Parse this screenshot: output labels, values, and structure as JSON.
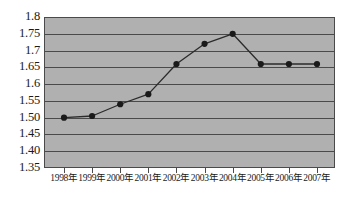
{
  "chart_data": {
    "type": "line",
    "title": "",
    "subtitle": "",
    "xlabel": "",
    "ylabel": "",
    "categories": [
      "1998年",
      "1999年",
      "2000年",
      "2001年",
      "2002年",
      "2003年",
      "2004年",
      "2005年",
      "2006年",
      "2007年"
    ],
    "series": [
      {
        "name": "",
        "values": [
          1.5,
          1.505,
          1.54,
          1.57,
          1.66,
          1.72,
          1.75,
          1.66,
          1.66,
          1.66
        ]
      }
    ],
    "ylim": [
      1.35,
      1.8
    ],
    "ytick_values": [
      1.8,
      1.75,
      1.7,
      1.65,
      1.6,
      1.55,
      1.5,
      1.45,
      1.4,
      1.35
    ],
    "ytick_labels": [
      "1.8",
      "1.75",
      "1.7",
      "1.65",
      "1.6",
      "1.55",
      "1.50",
      "1.45",
      "1.40",
      "1.35"
    ],
    "grid": true,
    "grid_axis": "y",
    "legend": false,
    "legend_position": "none",
    "marker": "filled-circle",
    "colors": {
      "plot_background": "#b0b0b0",
      "grid": "#4a4a4a",
      "border": "#4a4a4a",
      "line": "#2b2b2b",
      "marker": "#1a1a1a",
      "text": "#1a1a1a",
      "page_background": "#ffffff"
    }
  }
}
